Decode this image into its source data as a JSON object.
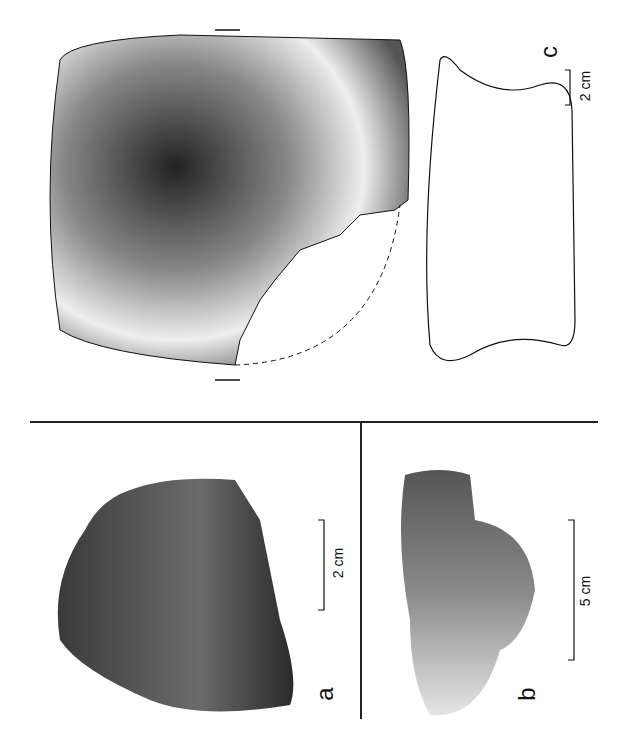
{
  "figure": {
    "panels": [
      {
        "id": "a",
        "label": "a",
        "kind": "photograph",
        "scale_bar": "2 cm"
      },
      {
        "id": "b",
        "label": "b",
        "kind": "photograph",
        "scale_bar": "5 cm"
      },
      {
        "id": "c",
        "label": "c",
        "kind": "drawing",
        "scale_bar": "2 cm"
      }
    ],
    "colors": {
      "ink": "#111111",
      "stone_dark": "#3a3a3a",
      "stone_mid": "#6b6b6b",
      "stone_light": "#d8d8d8"
    }
  }
}
